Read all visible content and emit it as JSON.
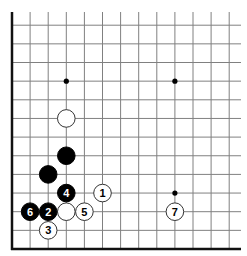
{
  "diagram": {
    "type": "go-board-fragment",
    "view": "lower-left corner",
    "grid": {
      "columns": 13,
      "rows": 13,
      "origin_x": 12,
      "origin_y": 249,
      "spacing_x": 18.1,
      "spacing_y": 18.65,
      "top_extent_y": 12,
      "right_extent_x": 241,
      "line_color": "#808080",
      "edge_color": "#111111"
    },
    "edges": [
      "left",
      "bottom"
    ],
    "star_points": [
      {
        "col": 3,
        "row": 3
      },
      {
        "col": 3,
        "row": 9
      },
      {
        "col": 9,
        "row": 3
      },
      {
        "col": 9,
        "row": 9
      }
    ],
    "stones": [
      {
        "color": "white",
        "col": 3,
        "row": 7,
        "label": ""
      },
      {
        "color": "black",
        "col": 3,
        "row": 5,
        "label": ""
      },
      {
        "color": "black",
        "col": 2,
        "row": 4,
        "label": ""
      },
      {
        "color": "white",
        "col": 3,
        "row": 2,
        "label": ""
      },
      {
        "color": "white",
        "col": 5,
        "row": 3,
        "label": "1"
      },
      {
        "color": "black",
        "col": 2,
        "row": 2,
        "label": "2"
      },
      {
        "color": "white",
        "col": 2,
        "row": 1,
        "label": "3"
      },
      {
        "color": "black",
        "col": 3,
        "row": 3,
        "label": "4"
      },
      {
        "color": "white",
        "col": 4,
        "row": 2,
        "label": "5"
      },
      {
        "color": "black",
        "col": 1,
        "row": 2,
        "label": "6"
      },
      {
        "color": "white",
        "col": 9,
        "row": 2,
        "label": "7"
      }
    ],
    "colors": {
      "black_stone": "#000000",
      "white_stone": "#ffffff",
      "white_stone_border": "#333333",
      "black_label": "#ffffff",
      "white_label": "#000000"
    }
  }
}
